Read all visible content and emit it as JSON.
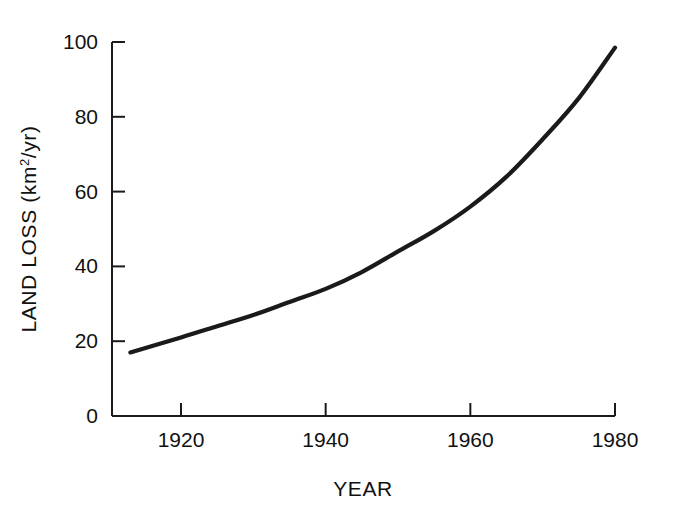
{
  "chart_data": {
    "type": "line",
    "title": "",
    "xlabel": "YEAR",
    "ylabel": "LAND LOSS (km2/yr)",
    "ylabel_base": "LAND LOSS (km",
    "ylabel_sup": "2",
    "ylabel_tail": "/yr)",
    "xlim": [
      1913,
      1980
    ],
    "ylim": [
      0,
      100
    ],
    "grid": false,
    "legend": null,
    "line_color": "#1a1a1a",
    "axis_color": "#1a1a1a",
    "background_color": "#ffffff",
    "xticks": [
      1920,
      1940,
      1960,
      1980
    ],
    "xtick_labels": [
      "1920",
      "1940",
      "1960",
      "1980"
    ],
    "yticks": [
      0,
      20,
      40,
      60,
      80,
      100
    ],
    "ytick_labels": [
      "0",
      "20",
      "40",
      "60",
      "80",
      "100"
    ],
    "series": [
      {
        "name": "Land loss rate",
        "x": [
          1913,
          1920,
          1925,
          1930,
          1935,
          1940,
          1945,
          1950,
          1955,
          1960,
          1965,
          1970,
          1975,
          1980
        ],
        "values": [
          17,
          21,
          24,
          27,
          30.5,
          34,
          38.5,
          44,
          49.5,
          56,
          64,
          74,
          85,
          98.5
        ]
      }
    ]
  },
  "axis_geometry": {
    "plot_left": 112,
    "plot_right": 615,
    "plot_top": 42,
    "plot_bottom": 416
  }
}
